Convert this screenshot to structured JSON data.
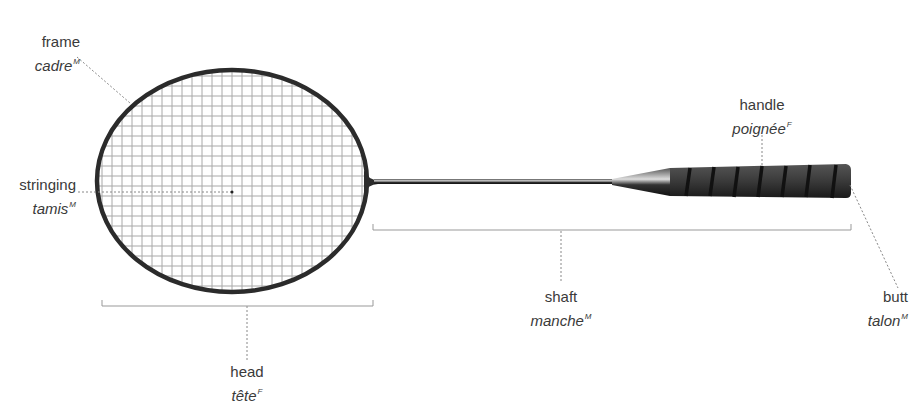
{
  "labels": {
    "frame": {
      "en": "frame",
      "fr": "cadre",
      "gender": "M"
    },
    "stringing": {
      "en": "stringing",
      "fr": "tamis",
      "gender": "M"
    },
    "handle": {
      "en": "handle",
      "fr": "poignée",
      "gender": "F"
    },
    "shaft": {
      "en": "shaft",
      "fr": "manche",
      "gender": "M"
    },
    "butt": {
      "en": "butt",
      "fr": "talon",
      "gender": "M"
    },
    "head": {
      "en": "head",
      "fr": "tête",
      "gender": "F"
    }
  },
  "colors": {
    "frame": "#2b2b2b",
    "strings": "#a8a8a8",
    "grip": "#3c3c3c",
    "grip_wrap": "#111111",
    "leader": "#888888",
    "text": "#3a3a3a"
  }
}
